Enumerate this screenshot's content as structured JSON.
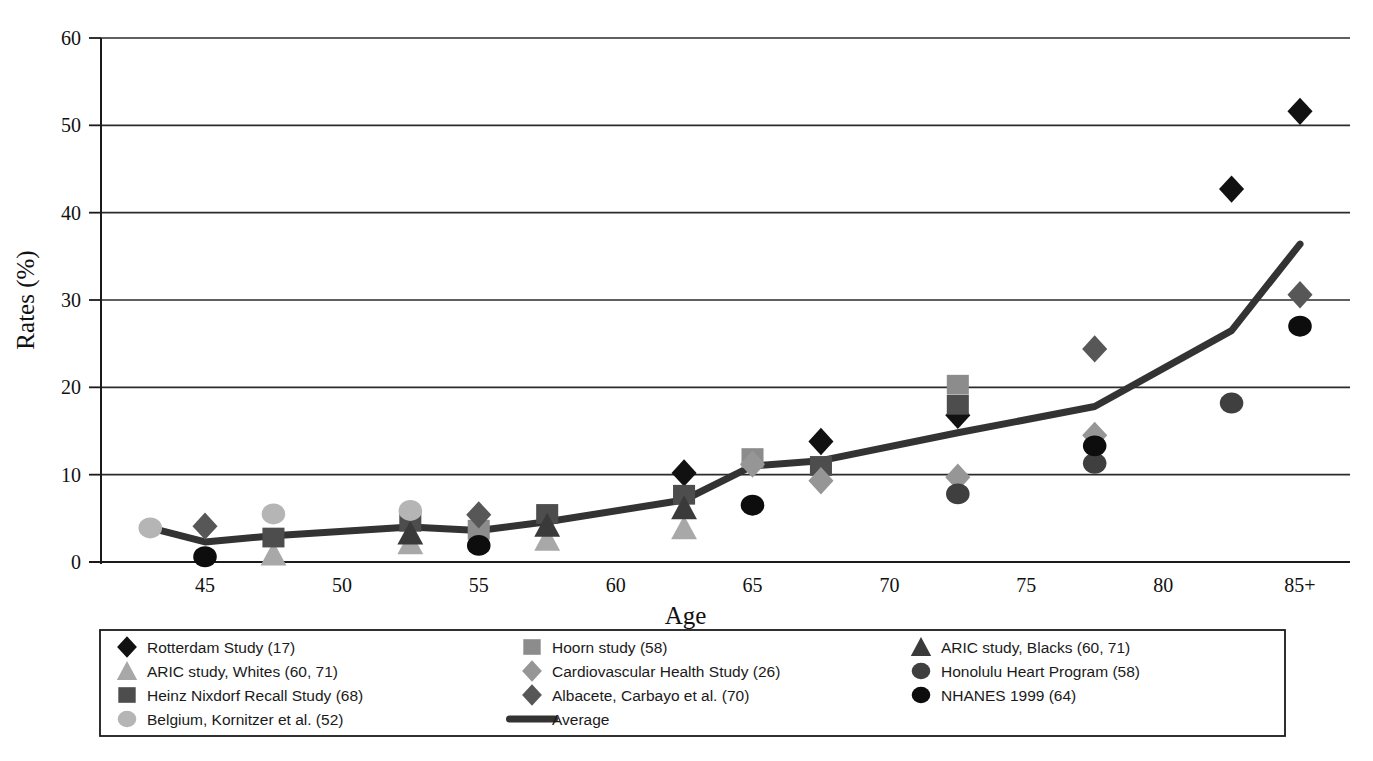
{
  "chart_data": {
    "type": "scatter",
    "title": "",
    "xlabel": "Age",
    "ylabel": "Rates (%)",
    "xlim": [
      42,
      87
    ],
    "ylim": [
      0,
      60
    ],
    "grid": true,
    "legend_position": "bottom",
    "x_tick_labels": [
      "45",
      "50",
      "55",
      "60",
      "65",
      "70",
      "75",
      "80",
      "85+"
    ],
    "x_tick_values": [
      45,
      50,
      55,
      60,
      65,
      70,
      75,
      80,
      85
    ],
    "y_tick_labels": [
      "0",
      "10",
      "20",
      "30",
      "40",
      "50",
      "60"
    ],
    "y_tick_values": [
      0,
      10,
      20,
      30,
      40,
      50,
      60
    ],
    "series": [
      {
        "name": "Rotterdam Study (17)",
        "marker": "diamond",
        "color": "#111111",
        "points": [
          {
            "x": 62.5,
            "y": 10.2
          },
          {
            "x": 67.5,
            "y": 13.8
          },
          {
            "x": 72.5,
            "y": 16.8
          },
          {
            "x": 82.5,
            "y": 42.7
          },
          {
            "x": 85,
            "y": 51.6
          }
        ]
      },
      {
        "name": "ARIC study, Whites (60, 71)",
        "marker": "triangle",
        "color": "#a8a8a8",
        "points": [
          {
            "x": 47.5,
            "y": 0.9
          },
          {
            "x": 52.5,
            "y": 2.2
          },
          {
            "x": 57.5,
            "y": 2.6
          },
          {
            "x": 62.5,
            "y": 3.9
          }
        ]
      },
      {
        "name": "Heinz Nixdorf Recall Study (68)",
        "marker": "square",
        "color": "#4d4d4d",
        "points": [
          {
            "x": 47.5,
            "y": 2.8
          },
          {
            "x": 52.5,
            "y": 4.6
          },
          {
            "x": 57.5,
            "y": 5.5
          },
          {
            "x": 62.5,
            "y": 7.7
          },
          {
            "x": 67.5,
            "y": 11.0
          },
          {
            "x": 72.5,
            "y": 18.0
          }
        ]
      },
      {
        "name": "Belgium, Kornitzer et al. (52)",
        "marker": "circle",
        "color": "#b5b5b5",
        "points": [
          {
            "x": 43,
            "y": 3.9
          },
          {
            "x": 47.5,
            "y": 5.5
          },
          {
            "x": 52.5,
            "y": 5.9
          }
        ]
      },
      {
        "name": "Hoorn study (58)",
        "marker": "square",
        "color": "#8c8c8c",
        "points": [
          {
            "x": 55,
            "y": 3.7
          },
          {
            "x": 65,
            "y": 11.9
          },
          {
            "x": 72.5,
            "y": 20.3
          }
        ]
      },
      {
        "name": "Cardiovascular Health Study (26)",
        "marker": "diamond",
        "color": "#969696",
        "points": [
          {
            "x": 65,
            "y": 11.2
          },
          {
            "x": 67.5,
            "y": 9.3
          },
          {
            "x": 72.5,
            "y": 9.7
          },
          {
            "x": 77.5,
            "y": 14.5
          }
        ]
      },
      {
        "name": "Albacete, Carbayo et al. (70)",
        "marker": "diamond",
        "color": "#575757",
        "points": [
          {
            "x": 45,
            "y": 4.1
          },
          {
            "x": 55,
            "y": 5.4
          },
          {
            "x": 77.5,
            "y": 24.4
          },
          {
            "x": 85,
            "y": 30.6
          }
        ]
      },
      {
        "name": "ARIC study, Blacks (60, 71)",
        "marker": "triangle",
        "color": "#3a3a3a",
        "points": [
          {
            "x": 52.5,
            "y": 3.3
          },
          {
            "x": 57.5,
            "y": 4.2
          },
          {
            "x": 62.5,
            "y": 6.2
          }
        ]
      },
      {
        "name": "Honolulu Heart Program (58)",
        "marker": "circle",
        "color": "#3f3f3f",
        "points": [
          {
            "x": 72.5,
            "y": 7.8
          },
          {
            "x": 77.5,
            "y": 11.3
          },
          {
            "x": 82.5,
            "y": 18.2
          }
        ]
      },
      {
        "name": "NHANES 1999 (64)",
        "marker": "circle",
        "color": "#0d0d0d",
        "points": [
          {
            "x": 45,
            "y": 0.6
          },
          {
            "x": 55,
            "y": 1.9
          },
          {
            "x": 65,
            "y": 6.5
          },
          {
            "x": 77.5,
            "y": 13.3
          },
          {
            "x": 85,
            "y": 27.0
          }
        ]
      }
    ],
    "average_line": {
      "name": "Average",
      "color": "#333333",
      "points": [
        {
          "x": 43,
          "y": 3.9
        },
        {
          "x": 45,
          "y": 2.3
        },
        {
          "x": 47.5,
          "y": 3.0
        },
        {
          "x": 52.5,
          "y": 4.0
        },
        {
          "x": 55,
          "y": 3.6
        },
        {
          "x": 57.5,
          "y": 4.6
        },
        {
          "x": 62.5,
          "y": 7.1
        },
        {
          "x": 65,
          "y": 11.0
        },
        {
          "x": 67.5,
          "y": 11.6
        },
        {
          "x": 72.5,
          "y": 14.8
        },
        {
          "x": 77.5,
          "y": 17.8
        },
        {
          "x": 82.5,
          "y": 26.5
        },
        {
          "x": 85,
          "y": 36.4
        }
      ]
    }
  },
  "legend": {
    "columns": [
      {
        "entries": [
          {
            "label": "Rotterdam Study (17)",
            "marker": "diamond",
            "color": "#111111"
          },
          {
            "label": "ARIC study, Whites (60, 71)",
            "marker": "triangle",
            "color": "#a8a8a8"
          },
          {
            "label": "Heinz Nixdorf Recall Study (68)",
            "marker": "square",
            "color": "#4d4d4d"
          },
          {
            "label": "Belgium, Kornitzer et al. (52)",
            "marker": "circle",
            "color": "#b5b5b5"
          }
        ]
      },
      {
        "entries": [
          {
            "label": "Hoorn study (58)",
            "marker": "square",
            "color": "#8c8c8c"
          },
          {
            "label": "Cardiovascular Health Study (26)",
            "marker": "diamond",
            "color": "#969696"
          },
          {
            "label": "Albacete, Carbayo et al. (70)",
            "marker": "diamond",
            "color": "#575757"
          },
          {
            "label": "Average",
            "marker": "line",
            "color": "#333333"
          }
        ]
      },
      {
        "entries": [
          {
            "label": "ARIC study, Blacks (60, 71)",
            "marker": "triangle",
            "color": "#3a3a3a"
          },
          {
            "label": "Honolulu Heart Program (58)",
            "marker": "circle",
            "color": "#3f3f3f"
          },
          {
            "label": "NHANES 1999 (64)",
            "marker": "circle",
            "color": "#0d0d0d"
          }
        ]
      }
    ]
  },
  "colors": {
    "axis": "#1a1a1a",
    "grid": "#2b2b2b",
    "background": "#ffffff"
  }
}
